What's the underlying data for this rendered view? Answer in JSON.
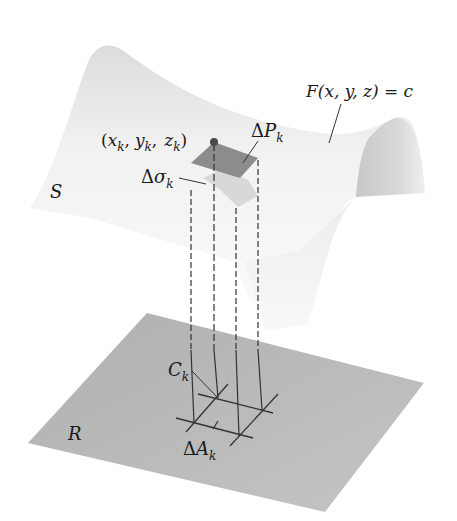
{
  "figure": {
    "surface_label": "S",
    "region_label": "R",
    "equation_label": "F(x,  y,  z) = c",
    "point_label": {
      "open": "(",
      "x": "x",
      "xsub": "k",
      "y": "y",
      "ysub": "k",
      "z": "z",
      "zsub": "k",
      "close": ")",
      "comma": ","
    },
    "delta_p": {
      "delta": "Δ",
      "main": "P",
      "sub": "k"
    },
    "delta_sigma": {
      "delta": "Δ",
      "main": "σ",
      "sub": "k"
    },
    "c_k": {
      "main": "C",
      "sub": "k"
    },
    "delta_a": {
      "delta": "Δ",
      "main": "A",
      "sub": "k"
    }
  },
  "colors": {
    "background": "#ffffff",
    "surface_light": "#f4f4f4",
    "surface_shade": "#cfcfcf",
    "patch_dark": "#8a8a8a",
    "patch_light": "#d6d6d6",
    "plane": "#b9b9b9",
    "ink": "#1a1a1a"
  }
}
